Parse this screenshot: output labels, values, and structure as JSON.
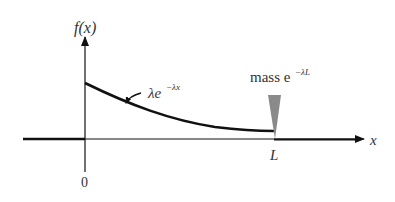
{
  "diagram": {
    "y_axis_label": "f(x)",
    "x_axis_label": "x",
    "origin_label": "0",
    "point_label": "L",
    "curve_label_base": "λe",
    "curve_label_exp": "−λx",
    "mass_label_base": "mass e",
    "mass_label_exp": "−λL",
    "colors": {
      "line": "#111111",
      "spike": "#8a8a8a",
      "text": "#333333"
    }
  }
}
